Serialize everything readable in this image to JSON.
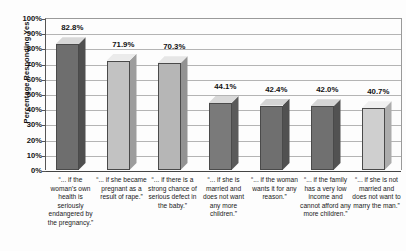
{
  "chart_data": {
    "type": "bar",
    "title": "",
    "xlabel": "",
    "ylabel": "Percentage Responding Yes",
    "ylim": [
      0,
      100
    ],
    "grid": true,
    "legend": "none",
    "value_suffix": "%",
    "y_ticks": [
      "100%",
      "90%",
      "80%",
      "70%",
      "60%",
      "50%",
      "40%",
      "30%",
      "20%",
      "10%",
      "0%"
    ],
    "y_tick_values": [
      100,
      90,
      80,
      70,
      60,
      50,
      40,
      30,
      20,
      10,
      0
    ],
    "categories": [
      "“... if the woman’s own health is seriously endangered by the pregnancy.”",
      "“... if she became pregnant as a result of rape.”",
      "“... if there is a strong chance of serious defect in the baby.”",
      "“... if she is married and does not want any more children.”",
      "“... if the woman wants it for any reason.”",
      "“... if the family has a very low income and cannot afford any more children.”",
      "“... if she is not married and does not want to marry the man.”"
    ],
    "values": [
      82.8,
      71.9,
      70.3,
      44.1,
      42.4,
      42.0,
      40.7
    ],
    "value_labels": [
      "82.8%",
      "71.9%",
      "70.3%",
      "44.1%",
      "42.4%",
      "42.0%",
      "40.7%"
    ],
    "bar_colors": [
      "#6e6e6e",
      "#c2c2c2",
      "#b6b6b6",
      "#7a7a7a",
      "#6f6f6f",
      "#707070",
      "#cfcfcf"
    ],
    "bar_top_colors": [
      "#d8d8d8",
      "#ebebeb",
      "#e6e6e6",
      "#d9d9d9",
      "#d4d4d4",
      "#d5d5d5",
      "#f0f0f0"
    ],
    "bar_side_colors": [
      "#4f4f4f",
      "#9d9d9d",
      "#939393",
      "#5a5a5a",
      "#515151",
      "#525252",
      "#acacac"
    ]
  },
  "axes": {
    "y_title": "Percentage Responding Yes"
  }
}
